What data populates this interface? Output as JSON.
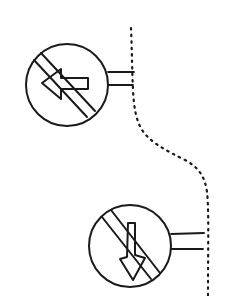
{
  "diagram": {
    "type": "line-drawing",
    "ink_color": "#1a1a1a",
    "background": "#ffffff",
    "signs": [
      {
        "id": "sign-no-left-turn",
        "symbol": "left-arrow",
        "prohibition_slash": true,
        "center": [
          67,
          85
        ],
        "radius": 42
      },
      {
        "id": "sign-no-down",
        "symbol": "down-arrow",
        "prohibition_slash": true,
        "center": [
          130,
          245
        ],
        "radius": 42
      }
    ],
    "curb": {
      "style": "dotted",
      "path": [
        [
          131,
          28
        ],
        [
          133,
          90
        ],
        [
          138,
          120
        ],
        [
          155,
          145
        ],
        [
          185,
          162
        ],
        [
          203,
          180
        ],
        [
          208,
          210
        ],
        [
          208,
          296
        ]
      ]
    }
  }
}
